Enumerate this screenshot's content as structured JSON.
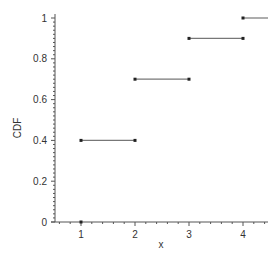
{
  "chart_data": {
    "type": "line",
    "subtype": "step-cdf",
    "title": "",
    "xlabel": "x",
    "ylabel": "CDF",
    "xlim": [
      0.5,
      4.5
    ],
    "ylim": [
      0,
      1
    ],
    "x_ticks": [
      1,
      2,
      3,
      4
    ],
    "x_tick_labels": [
      "1",
      "2",
      "3",
      "4"
    ],
    "y_ticks": [
      0,
      0.2,
      0.4,
      0.6,
      0.8,
      1
    ],
    "y_tick_labels": [
      "0",
      "0.2",
      "0.4",
      "0.6",
      "0.8",
      "1"
    ],
    "grid": false,
    "legend": null,
    "segments": [
      {
        "x_start": 1,
        "x_end": 1,
        "y": 0
      },
      {
        "x_start": 1,
        "x_end": 2,
        "y": 0.4
      },
      {
        "x_start": 2,
        "x_end": 3,
        "y": 0.7
      },
      {
        "x_start": 3,
        "x_end": 4,
        "y": 0.9
      },
      {
        "x_start": 4,
        "x_end": 4.5,
        "y": 1.0
      }
    ],
    "colors": {
      "axis": "#555555",
      "line": "#777777",
      "point": "#222222"
    }
  }
}
